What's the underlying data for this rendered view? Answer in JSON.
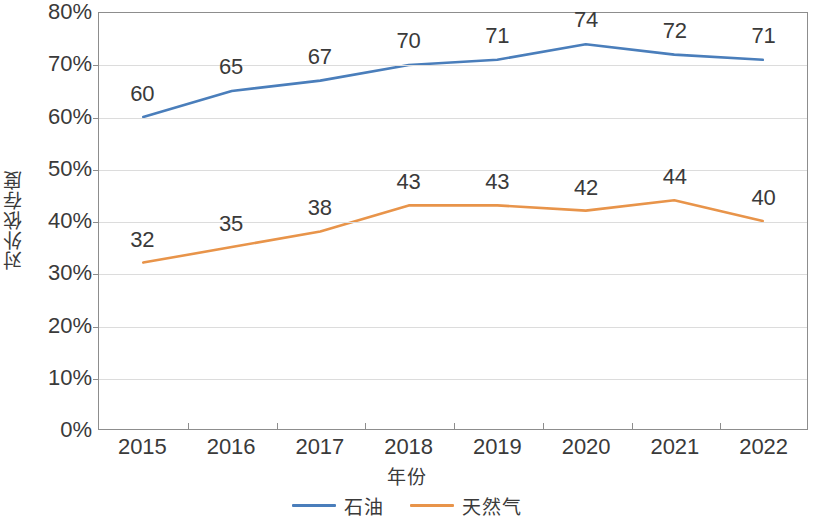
{
  "chart_data": {
    "type": "line",
    "title": "",
    "xlabel": "年份",
    "ylabel": "对外依存度",
    "categories": [
      "2015",
      "2016",
      "2017",
      "2018",
      "2019",
      "2020",
      "2021",
      "2022"
    ],
    "series": [
      {
        "name": "石油",
        "color": "#4a7ebb",
        "values": [
          60,
          65,
          67,
          70,
          71,
          74,
          72,
          71
        ],
        "labels": [
          "60",
          "65",
          "67",
          "70",
          "71",
          "74",
          "72",
          "71"
        ]
      },
      {
        "name": "天然气",
        "color": "#e8944a",
        "values": [
          32,
          35,
          38,
          43,
          43,
          42,
          44,
          40
        ],
        "labels": [
          "32",
          "35",
          "38",
          "43",
          "43",
          "42",
          "44",
          "40"
        ]
      }
    ],
    "ylim": [
      0,
      80
    ],
    "ytick_labels": [
      "0%",
      "10%",
      "20%",
      "30%",
      "40%",
      "50%",
      "60%",
      "70%",
      "80%"
    ],
    "ytick_values": [
      0,
      10,
      20,
      30,
      40,
      50,
      60,
      70,
      80
    ],
    "grid": true,
    "legend_position": "bottom",
    "value_unit": "%",
    "axis_color": "#8d8d8d",
    "grid_color": "#dcdcdc"
  },
  "legend": {
    "items": [
      {
        "label": "石油",
        "color": "#4a7ebb"
      },
      {
        "label": "天然气",
        "color": "#e8944a"
      }
    ]
  }
}
